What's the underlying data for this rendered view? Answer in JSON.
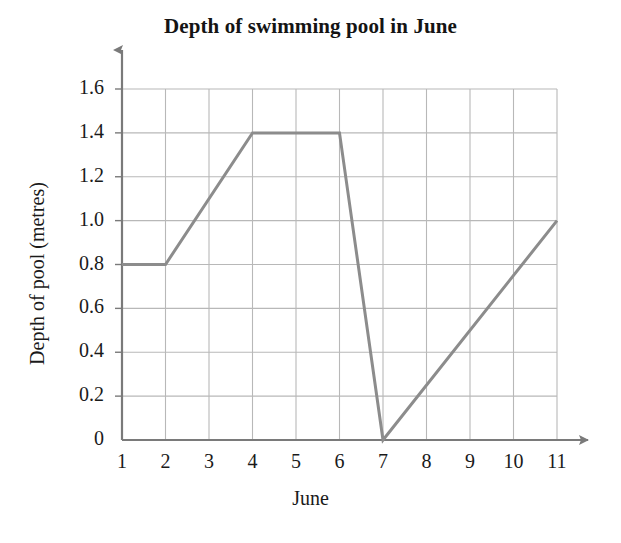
{
  "chart_data": {
    "type": "line",
    "title": "Depth of swimming pool in June",
    "xlabel": "June",
    "ylabel": "Depth of pool (metres)",
    "x": [
      1,
      2,
      4,
      6,
      7,
      11
    ],
    "values": [
      0.8,
      0.8,
      1.4,
      1.4,
      0.0,
      1.0
    ],
    "series": [
      {
        "name": "Depth of pool",
        "points": [
          {
            "x": 1,
            "y": 0.8
          },
          {
            "x": 2,
            "y": 0.8
          },
          {
            "x": 4,
            "y": 1.4
          },
          {
            "x": 6,
            "y": 1.4
          },
          {
            "x": 7,
            "y": 0.0
          },
          {
            "x": 11,
            "y": 1.0
          }
        ]
      }
    ],
    "xlim": [
      1,
      11
    ],
    "ylim": [
      0,
      1.6
    ],
    "xticks": [
      1,
      2,
      3,
      4,
      5,
      6,
      7,
      8,
      9,
      10,
      11
    ],
    "xtick_labels": [
      "1",
      "2",
      "3",
      "4",
      "5",
      "6",
      "7",
      "8",
      "9",
      "10",
      "11"
    ],
    "yticks": [
      0,
      0.2,
      0.4,
      0.6,
      0.8,
      1.0,
      1.2,
      1.4,
      1.6
    ],
    "ytick_labels": [
      "0",
      "0.2",
      "0.4",
      "0.6",
      "0.8",
      "1.0",
      "1.2",
      "1.4",
      "1.6"
    ],
    "grid": true,
    "legend": false,
    "line_color": "#8c8c8c",
    "grid_color": "#b8b8b8",
    "axis_color": "#7a7a7a",
    "background_color": "#ffffff"
  }
}
